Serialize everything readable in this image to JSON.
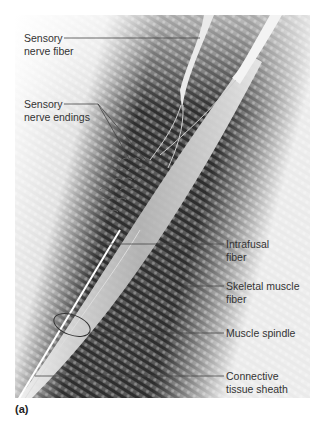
{
  "figure": {
    "panel_label": "(a)",
    "labels": [
      {
        "id": "sensory-nerve-fiber",
        "text": "Sensory\nnerve fiber"
      },
      {
        "id": "sensory-nerve-endings",
        "text": "Sensory\nnerve endings"
      },
      {
        "id": "intrafusal-fiber",
        "text": "Intrafusal\nfiber"
      },
      {
        "id": "skeletal-muscle-fiber",
        "text": "Skeletal muscle\nfiber"
      },
      {
        "id": "muscle-spindle",
        "text": "Muscle spindle"
      },
      {
        "id": "connective-tissue-sheath",
        "text": "Connective\ntissue sheath"
      }
    ]
  }
}
